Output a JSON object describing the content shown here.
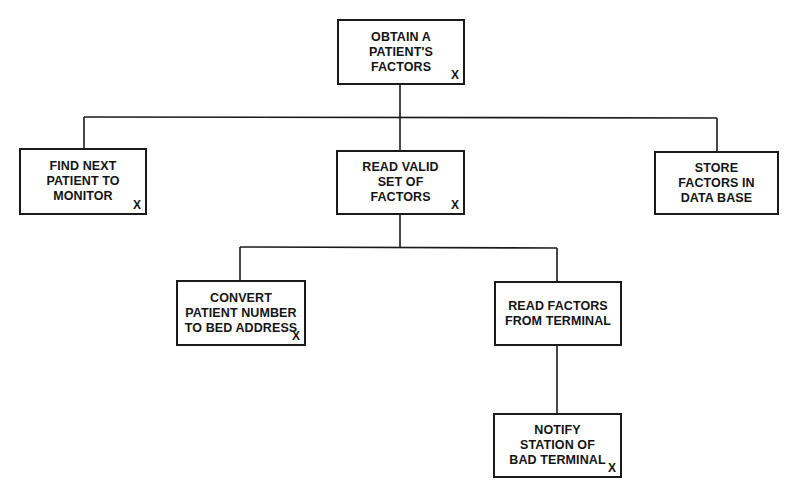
{
  "diagram": {
    "type": "hierarchy-chart",
    "nodes": [
      {
        "id": "root",
        "label": "OBTAIN A\nPATIENT'S\nFACTORS",
        "mark": "X",
        "x": 337,
        "y": 19,
        "w": 128,
        "h": 66
      },
      {
        "id": "find-next",
        "label": "FIND NEXT\nPATIENT TO\nMONITOR",
        "mark": "X",
        "x": 19,
        "y": 148,
        "w": 128,
        "h": 67
      },
      {
        "id": "read-valid",
        "label": "READ VALID\nSET OF\nFACTORS",
        "mark": "X",
        "x": 336,
        "y": 150,
        "w": 129,
        "h": 65
      },
      {
        "id": "store",
        "label": "STORE\nFACTORS IN\nDATA BASE",
        "mark": "",
        "x": 654,
        "y": 151,
        "w": 125,
        "h": 64
      },
      {
        "id": "convert",
        "label": "CONVERT\nPATIENT NUMBER\nTO BED ADDRESS",
        "mark": "X",
        "x": 176,
        "y": 280,
        "w": 130,
        "h": 66
      },
      {
        "id": "read-factors",
        "label": "READ FACTORS\nFROM TERMINAL",
        "mark": "",
        "x": 494,
        "y": 281,
        "w": 128,
        "h": 65
      },
      {
        "id": "notify",
        "label": "NOTIFY\nSTATION OF\nBAD TERMINAL",
        "mark": "X",
        "x": 493,
        "y": 413,
        "w": 129,
        "h": 65
      }
    ],
    "edges": [
      {
        "from": "root",
        "to": "find-next"
      },
      {
        "from": "root",
        "to": "read-valid"
      },
      {
        "from": "root",
        "to": "store"
      },
      {
        "from": "read-valid",
        "to": "convert"
      },
      {
        "from": "read-valid",
        "to": "read-factors"
      },
      {
        "from": "read-factors",
        "to": "notify"
      }
    ],
    "line_color": "#1a1a1a",
    "background": "#ffffff"
  }
}
